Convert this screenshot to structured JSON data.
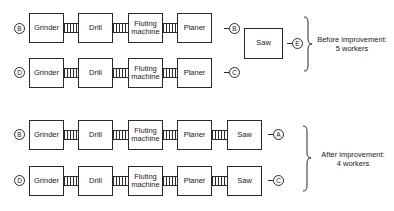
{
  "diagram": {
    "title": "",
    "before": {
      "caption_line1": "Before improvement:",
      "caption_line2": "5 workers",
      "rows": [
        {
          "worker": "B",
          "stations": [
            "Grinder",
            "Drill",
            "Fluting machine",
            "Planer"
          ],
          "output": "B"
        },
        {
          "worker": "D",
          "stations": [
            "Grinder",
            "Drill",
            "Fluting machine",
            "Planer"
          ],
          "output": "C"
        }
      ],
      "shared_station": {
        "name": "Saw",
        "worker": "E"
      }
    },
    "after": {
      "caption_line1": "After improvement:",
      "caption_line2": "4 workers",
      "rows": [
        {
          "worker": "B",
          "stations": [
            "Grinder",
            "Drill",
            "Fluting machine",
            "Planer",
            "Saw"
          ],
          "output": "A"
        },
        {
          "worker": "D",
          "stations": [
            "Grinder",
            "Drill",
            "Fluting machine",
            "Planer",
            "Saw"
          ],
          "output": "C"
        }
      ]
    }
  },
  "labels": {
    "grinder": "Grinder",
    "drill": "Drill",
    "fluting1": "Fluting",
    "fluting2": "machine",
    "planer": "Planer",
    "saw": "Saw"
  },
  "circles": {
    "r1_in": "B",
    "r1_out": "B",
    "r2_in": "D",
    "r2_out": "C",
    "saw_before": "E",
    "r3_in": "B",
    "r3_out": "A",
    "r4_in": "D",
    "r4_out": "C"
  }
}
